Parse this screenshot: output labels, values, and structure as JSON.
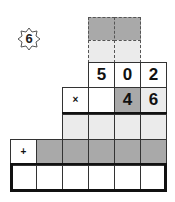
{
  "badge": {
    "number": "6",
    "shape": "eight-point-star"
  },
  "problem": {
    "multiplicand": [
      "5",
      "0",
      "2"
    ],
    "multiplier": [
      "4",
      "6"
    ],
    "multiply_sign": "×",
    "add_sign": "+"
  },
  "colors": {
    "dark_cell": "#a9a9a9",
    "light_cell": "#ebebeb",
    "border": "#333333"
  }
}
